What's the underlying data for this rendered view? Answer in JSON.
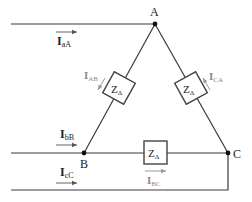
{
  "diagram": {
    "nodes": {
      "A": {
        "label": "A"
      },
      "B": {
        "label": "B"
      },
      "C": {
        "label": "C"
      }
    },
    "impedances": {
      "ab": {
        "label_main": "Z",
        "label_sub": "Δ"
      },
      "ca": {
        "label_main": "Z",
        "label_sub": "Δ"
      },
      "bc": {
        "label_main": "Z",
        "label_sub": "Δ"
      }
    },
    "line_currents": {
      "aA": {
        "main": "I",
        "sub": "aA"
      },
      "bB": {
        "main": "I",
        "sub": "bB"
      },
      "cC": {
        "main": "I",
        "sub": "cC"
      }
    },
    "phase_currents": {
      "AB": {
        "main": "I",
        "sub": "AB"
      },
      "CA": {
        "main": "I",
        "sub": "CA"
      },
      "BC": {
        "main": "I",
        "sub": "BC"
      }
    },
    "colors": {
      "wire": "#3a3a3a",
      "phase_current_label": "#8a8a8a"
    }
  }
}
